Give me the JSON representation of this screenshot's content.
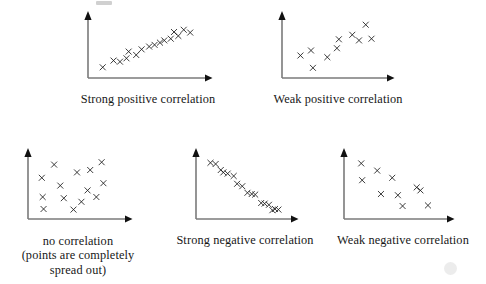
{
  "figure": {
    "background_color": "#ffffff",
    "axis_color": "#7a7a7a",
    "marker_color": "#1a1a1a",
    "marker_glyph": "x"
  },
  "panels": [
    {
      "id": "strong-positive",
      "caption_lines": [
        "Strong positive correlation"
      ],
      "chart_data": {
        "type": "scatter",
        "title": "Strong positive correlation",
        "xlabel": "",
        "ylabel": "",
        "xlim": [
          0,
          100
        ],
        "ylim": [
          0,
          100
        ],
        "grid": false,
        "legend": false,
        "series": [
          {
            "name": "points",
            "x": [
              9,
              19,
              25,
              31,
              33,
              40,
              45,
              52,
              57,
              62,
              66,
              72,
              75,
              79,
              84,
              90
            ],
            "y": [
              12,
              24,
              22,
              28,
              40,
              34,
              44,
              49,
              52,
              56,
              60,
              63,
              75,
              68,
              79,
              74
            ]
          }
        ]
      }
    },
    {
      "id": "weak-positive",
      "caption_lines": [
        "Weak positive correlation"
      ],
      "chart_data": {
        "type": "scatter",
        "title": "Weak positive correlation",
        "xlabel": "",
        "ylabel": "",
        "xlim": [
          0,
          100
        ],
        "ylim": [
          0,
          100
        ],
        "grid": false,
        "legend": false,
        "series": [
          {
            "name": "points",
            "x": [
              14,
              25,
              27,
              42,
              52,
              54,
              68,
              75,
              82,
              88
            ],
            "y": [
              33,
              42,
              11,
              30,
              46,
              62,
              70,
              60,
              88,
              63
            ]
          }
        ]
      }
    },
    {
      "id": "no-correlation",
      "caption_lines": [
        "no correlation",
        "(points are completely",
        "spread out)"
      ],
      "chart_data": {
        "type": "scatter",
        "title": "no correlation",
        "xlabel": "",
        "ylabel": "",
        "xlim": [
          0,
          100
        ],
        "ylim": [
          0,
          100
        ],
        "grid": false,
        "legend": false,
        "series": [
          {
            "name": "points",
            "x": [
              10,
              11,
              12,
              24,
              31,
              35,
              46,
              50,
              55,
              62,
              65,
              72,
              78,
              80
            ],
            "y": [
              62,
              30,
              10,
              84,
              49,
              28,
              9,
              71,
              22,
              41,
              75,
              30,
              88,
              53
            ]
          }
        ]
      }
    },
    {
      "id": "strong-negative",
      "caption_lines": [
        "Strong negative correlation"
      ],
      "chart_data": {
        "type": "scatter",
        "title": "Strong negative correlation",
        "xlabel": "",
        "ylabel": "",
        "xlim": [
          0,
          100
        ],
        "ylim": [
          0,
          100
        ],
        "grid": false,
        "legend": false,
        "series": [
          {
            "name": "points",
            "x": [
              11,
              17,
              23,
              26,
              31,
              38,
              42,
              48,
              54,
              59,
              63,
              70,
              74,
              79,
              83,
              86,
              90
            ],
            "y": [
              87,
              85,
              75,
              71,
              69,
              65,
              52,
              48,
              37,
              35,
              34,
              20,
              19,
              17,
              8,
              10,
              9
            ]
          }
        ]
      }
    },
    {
      "id": "weak-negative",
      "caption_lines": [
        "Weak negative correlation"
      ],
      "chart_data": {
        "type": "scatter",
        "title": "Weak negative correlation",
        "xlabel": "",
        "ylabel": "",
        "xlim": [
          0,
          100
        ],
        "ylim": [
          0,
          100
        ],
        "grid": false,
        "legend": false,
        "series": [
          {
            "name": "points",
            "x": [
              13,
              14,
              30,
              34,
              46,
              52,
              57,
              72,
              76,
              84
            ],
            "y": [
              86,
              58,
              74,
              35,
              62,
              33,
              15,
              46,
              41,
              16
            ]
          }
        ]
      }
    }
  ]
}
